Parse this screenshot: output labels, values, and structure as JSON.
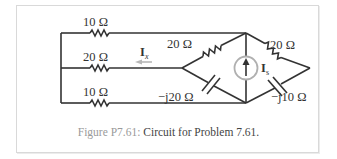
{
  "figure": {
    "caption_tag": "Figure P7.61:",
    "caption_text": " Circuit for Problem 7.61."
  },
  "components": {
    "r_top": "10 Ω",
    "r_mid": "20 Ω",
    "r_bot": "10 Ω",
    "r_diamond_left": "20 Ω",
    "r_diamond_right": "20 Ω",
    "c_left": "−j20 Ω",
    "c_right": "−j10 Ω",
    "current_source": "I",
    "current_source_sub": "s",
    "current_x": "I",
    "current_x_sub": "x"
  },
  "colors": {
    "wire": "#333333",
    "source_circle": "#b0b0b0",
    "arrow_ix": "#b8b8b8",
    "caption_tag": "#9a9a9a",
    "frame": "#d9d9d9"
  }
}
